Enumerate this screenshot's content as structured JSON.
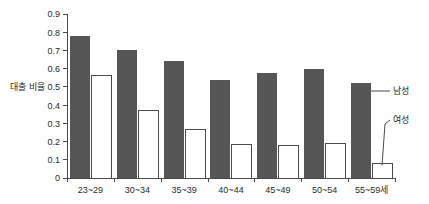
{
  "chart_data": {
    "type": "bar",
    "title": "",
    "xlabel": "",
    "ylabel": "대출 비율",
    "ylim": [
      0,
      0.9
    ],
    "grid": false,
    "legend_position": "annotation-right",
    "categories": [
      "23~29",
      "30~34",
      "35~39",
      "40~44",
      "45~49",
      "50~54",
      "55~59세"
    ],
    "ytick_labels": [
      "0.9",
      "0.8",
      "0.7",
      "0.6",
      "0.5",
      "0.4",
      "0.3",
      "0.2",
      "0.1",
      "0"
    ],
    "ytick_values": [
      0.9,
      0.8,
      0.7,
      0.6,
      0.5,
      0.4,
      0.3,
      0.2,
      0.1,
      0
    ],
    "series": [
      {
        "name": "남성",
        "color": "#565656",
        "style": "filled",
        "values": [
          0.78,
          0.7,
          0.64,
          0.54,
          0.575,
          0.6,
          0.52
        ]
      },
      {
        "name": "여성",
        "color": "#ffffff",
        "style": "outlined",
        "values": [
          0.565,
          0.37,
          0.265,
          0.185,
          0.18,
          0.19,
          0.08
        ]
      }
    ],
    "annotations": [
      {
        "text": "남성",
        "target_series": "남성",
        "target_category": "55~59세",
        "leader": "horizontal"
      },
      {
        "text": "여성",
        "target_series": "여성",
        "target_category": "55~59세",
        "leader": "diagonal"
      }
    ]
  },
  "colors": {
    "male_bar": "#565656",
    "female_bar_fill": "#ffffff",
    "female_bar_stroke": "#4a4a4a",
    "axis": "#4a4a4a",
    "text": "#2b2b2b",
    "background": "#ffffff"
  }
}
